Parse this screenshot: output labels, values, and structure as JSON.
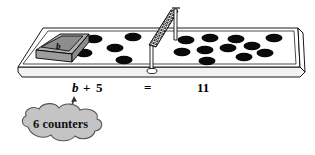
{
  "diagram": {
    "mat": {
      "name": "equation-mat",
      "surface_color": "#ffffff",
      "outline_color": "#000000",
      "edge_color": "#e8e8e8"
    },
    "divider": {
      "name": "mesh-net-divider",
      "mesh_color": "#3a3a3a",
      "post_color": "#ffffff"
    },
    "variable_box": {
      "label": "b",
      "top_color": "#b3b3b3",
      "side_color": "#9a9a9a",
      "inner_color": "#8f8f8f",
      "outline_color": "#000000"
    },
    "counter_color": "#0a0a0a",
    "left_side": {
      "name": "left-pan",
      "counter_count": 5,
      "counters": [
        {
          "cx": 94,
          "cy": 39
        },
        {
          "cx": 133,
          "cy": 37
        },
        {
          "cx": 115,
          "cy": 48
        },
        {
          "cx": 84,
          "cy": 53
        },
        {
          "cx": 124,
          "cy": 60
        }
      ]
    },
    "right_side": {
      "name": "right-pan",
      "counter_count": 11,
      "counters": [
        {
          "cx": 186,
          "cy": 40
        },
        {
          "cx": 210,
          "cy": 38
        },
        {
          "cx": 236,
          "cy": 39
        },
        {
          "cx": 252,
          "cy": 46
        },
        {
          "cx": 274,
          "cy": 38
        },
        {
          "cx": 182,
          "cy": 52
        },
        {
          "cx": 205,
          "cy": 50
        },
        {
          "cx": 228,
          "cy": 48
        },
        {
          "cx": 244,
          "cy": 57
        },
        {
          "cx": 207,
          "cy": 61
        },
        {
          "cx": 265,
          "cy": 53
        }
      ]
    },
    "equation": {
      "name": "equation-line",
      "variable": "b",
      "plus": "+",
      "addend": "5",
      "equals": "=",
      "result": "11",
      "full": "b + 5 = 11"
    },
    "callout": {
      "name": "counters-callout",
      "text": "6 counters",
      "fill_color": "#c4c4c4",
      "outline_color": "#555555",
      "arrow_color": "#333333"
    }
  }
}
